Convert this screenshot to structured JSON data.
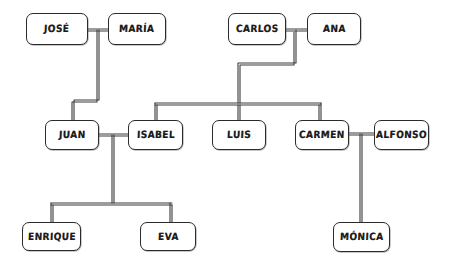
{
  "diagram": {
    "type": "family-tree",
    "style": "hand-drawn",
    "background_color": "#ffffff",
    "line_color": "#3a3a3a",
    "box_border_color": "#2b2b2b",
    "text_color": "#1c1c1c"
  },
  "nodes": [
    {
      "id": "jose",
      "label": "José",
      "x": 26,
      "y": 13,
      "w": 62,
      "h": 32,
      "generation": 1
    },
    {
      "id": "maria",
      "label": "María",
      "x": 108,
      "y": 13,
      "w": 58,
      "h": 32,
      "generation": 1
    },
    {
      "id": "carlos",
      "label": "Carlos",
      "x": 228,
      "y": 13,
      "w": 58,
      "h": 32,
      "generation": 1
    },
    {
      "id": "ana",
      "label": "Ana",
      "x": 307,
      "y": 13,
      "w": 54,
      "h": 32,
      "generation": 1
    },
    {
      "id": "juan",
      "label": "Juan",
      "x": 45,
      "y": 120,
      "w": 54,
      "h": 30,
      "generation": 2
    },
    {
      "id": "isabel",
      "label": "Isabel",
      "x": 128,
      "y": 120,
      "w": 55,
      "h": 30,
      "generation": 2
    },
    {
      "id": "luis",
      "label": "Luis",
      "x": 212,
      "y": 120,
      "w": 54,
      "h": 30,
      "generation": 2
    },
    {
      "id": "carmen",
      "label": "Carmen",
      "x": 295,
      "y": 120,
      "w": 54,
      "h": 30,
      "generation": 2
    },
    {
      "id": "alfonso",
      "label": "Alfonso",
      "x": 374,
      "y": 120,
      "w": 55,
      "h": 30,
      "generation": 2
    },
    {
      "id": "enrique",
      "label": "Enrique",
      "x": 22,
      "y": 222,
      "w": 59,
      "h": 29,
      "generation": 3
    },
    {
      "id": "eva",
      "label": "Eva",
      "x": 140,
      "y": 222,
      "w": 56,
      "h": 29,
      "generation": 3
    },
    {
      "id": "monica",
      "label": "Mónica",
      "x": 333,
      "y": 222,
      "w": 57,
      "h": 30,
      "generation": 3
    }
  ],
  "connections": [
    {
      "id": "jose-maria",
      "type": "spouse",
      "from": "jose",
      "to": "maria"
    },
    {
      "id": "carlos-ana",
      "type": "spouse",
      "from": "carlos",
      "to": "ana"
    },
    {
      "id": "juan-isabel",
      "type": "spouse",
      "from": "juan",
      "to": "isabel"
    },
    {
      "id": "carmen-alfonso",
      "type": "spouse",
      "from": "carmen",
      "to": "alfonso"
    },
    {
      "id": "jose-maria-juan",
      "type": "child",
      "from": "jose-maria",
      "to": "juan"
    },
    {
      "id": "carlos-isabel",
      "type": "child",
      "from": "carlos-ana",
      "to": "isabel"
    },
    {
      "id": "carlos-luis",
      "type": "child",
      "from": "carlos-ana",
      "to": "luis"
    },
    {
      "id": "carlos-carmen",
      "type": "child",
      "from": "carlos-ana",
      "to": "carmen"
    },
    {
      "id": "juan-enrique",
      "type": "child",
      "from": "juan-isabel",
      "to": "enrique"
    },
    {
      "id": "juan-eva",
      "type": "child",
      "from": "juan-isabel",
      "to": "eva"
    },
    {
      "id": "carmen-monica",
      "type": "child",
      "from": "carmen-alfonso",
      "to": "monica"
    }
  ]
}
